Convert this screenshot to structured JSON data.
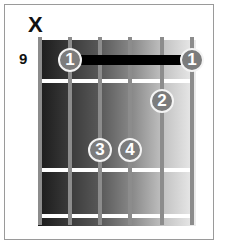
{
  "diagram": {
    "type": "guitar-chord-diagram",
    "start_fret": "9",
    "muted_string_marker": "X",
    "muted_string": 6,
    "strings": 6,
    "frets_shown": 4,
    "colors": {
      "board_dark": "#1a1a1a",
      "board_light": "#ececec",
      "string": "#8c8c8c",
      "fret": "#ffffff",
      "finger_dot": "#7c7c7c",
      "barre": "#000000"
    },
    "barre": {
      "finger": "1",
      "fret": 1,
      "from_string": 5,
      "to_string": 1
    },
    "fingers": [
      {
        "label": "1",
        "string": 5,
        "fret": 1
      },
      {
        "label": "1",
        "string": 1,
        "fret": 1
      },
      {
        "label": "2",
        "string": 2,
        "fret": 2
      },
      {
        "label": "3",
        "string": 4,
        "fret": 3
      },
      {
        "label": "4",
        "string": 3,
        "fret": 3
      }
    ]
  }
}
